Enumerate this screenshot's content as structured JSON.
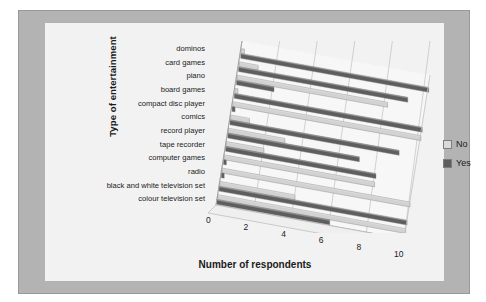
{
  "chart_data": {
    "type": "bar",
    "orientation": "horizontal",
    "style": "3d-clustered-bar",
    "title": "",
    "xlabel": "Number of respondents",
    "ylabel": "Type of entertainment",
    "xlim": [
      0,
      10
    ],
    "xticks": [
      0,
      2,
      4,
      6,
      8,
      10
    ],
    "xtick_labels": [
      "0",
      "2",
      "4",
      "6",
      "8",
      "10"
    ],
    "grid": true,
    "legend_position": "right",
    "categories": [
      "dominos",
      "card games",
      "piano",
      "board games",
      "compact disc player",
      "comics",
      "record player",
      "tape recorder",
      "computer games",
      "radio",
      "black and white television set",
      "colour television set"
    ],
    "series": [
      {
        "name": "No",
        "color": "#d2d2d2",
        "values": [
          0,
          1,
          8,
          0,
          10,
          1,
          3,
          2,
          8,
          10,
          4,
          10
        ]
      },
      {
        "name": "Yes",
        "color": "#5e5e5e",
        "values": [
          10,
          9,
          2,
          10,
          0,
          9,
          7,
          8,
          0,
          0,
          10,
          6
        ]
      }
    ]
  },
  "legend": {
    "items": [
      {
        "label": "No",
        "swatch": "light-gray"
      },
      {
        "label": "Yes",
        "swatch": "dark-gray"
      }
    ]
  },
  "colors": {
    "card_background": "#b3b3b3",
    "plot_background": "#f2f2f2",
    "no_bar": "#d2d2d2",
    "yes_bar": "#5e5e5e",
    "text": "#1b1b1b",
    "gridline": "#bdbdbd"
  }
}
